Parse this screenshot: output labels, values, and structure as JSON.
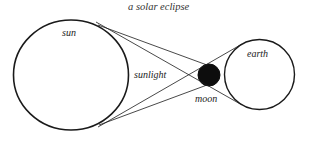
{
  "diagram": {
    "title": "a solar eclipse",
    "labels": {
      "sun": "sun",
      "sunlight": "sunlight",
      "moon": "moon",
      "earth": "earth"
    },
    "colors": {
      "stroke": "#1a1a1a",
      "moon_fill": "#0d0d0d",
      "background": "#ffffff"
    },
    "bodies": {
      "sun": {
        "cx": 71,
        "cy": 75,
        "r": 57
      },
      "moon": {
        "cx": 209,
        "cy": 75,
        "r": 11
      },
      "earth": {
        "cx": 259,
        "cy": 74,
        "r": 35
      }
    }
  }
}
